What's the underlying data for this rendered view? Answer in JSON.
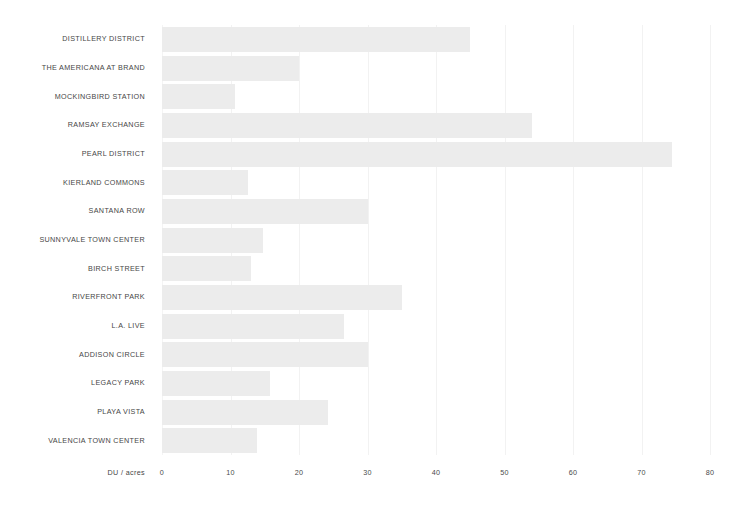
{
  "chart_data": {
    "type": "bar",
    "orientation": "horizontal",
    "title": "",
    "xlabel": "DU / acres",
    "ylabel": "",
    "xlim": [
      0,
      80
    ],
    "xticks": [
      0,
      10,
      20,
      30,
      40,
      50,
      60,
      70,
      80
    ],
    "xtick_labels": [
      "0",
      "10",
      "20",
      "30",
      "40",
      "50",
      "60",
      "70",
      "80"
    ],
    "grid": "vertical",
    "legend": "none",
    "bar_color": "#ececec",
    "gridline_color": "#f2f2f2",
    "label_color": "#464646",
    "categories": [
      "DISTILLERY DISTRICT",
      "THE AMERICANA AT BRAND",
      "MOCKINGBIRD STATION",
      "RAMSAY EXCHANGE",
      "PEARL DISTRICT",
      "KIERLAND COMMONS",
      "SANTANA ROW",
      "SUNNYVALE TOWN CENTER",
      "BIRCH STREET",
      "RIVERFRONT PARK",
      "L.A. LIVE",
      "ADDISON CIRCLE",
      "LEGACY PARK",
      "PLAYA VISTA",
      "VALENCIA TOWN CENTER"
    ],
    "values": [
      45,
      20,
      10.6,
      54,
      74.5,
      12.5,
      30,
      14.7,
      13,
      35,
      26.5,
      30,
      15.8,
      24.2,
      13.8
    ]
  }
}
